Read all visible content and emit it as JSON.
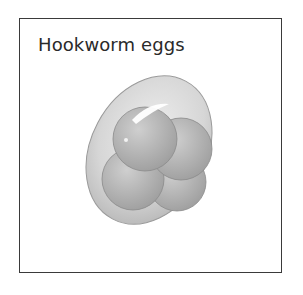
{
  "figure": {
    "title": "Hookworm eggs",
    "illustration": "hookworm-egg-illustration"
  },
  "colors": {
    "border": "#3a3a3a",
    "shell": "#dcdcdc",
    "cell": "#b8b8b8",
    "text": "#2a2a2a"
  }
}
